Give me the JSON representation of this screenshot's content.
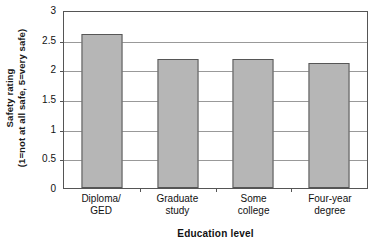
{
  "chart_data": {
    "type": "bar",
    "title": "",
    "categories": [
      "Diploma/ GED",
      "Graduate study",
      "Some college",
      "Four-year degree"
    ],
    "category_lines": [
      [
        "Diploma/",
        "GED"
      ],
      [
        "Graduate",
        "study"
      ],
      [
        "Some",
        "college"
      ],
      [
        "Four-year",
        "degree"
      ]
    ],
    "values": [
      2.6,
      2.18,
      2.17,
      2.1
    ],
    "xlabel": "Education level",
    "ylabel": "Safety rating",
    "ylabel_sub": "(1=not at all safe, 5=very safe)",
    "ylim": [
      0,
      3
    ],
    "ytick_values": [
      3,
      2.5,
      2,
      1.5,
      1,
      0.5,
      0
    ],
    "ytick_labels": [
      "3",
      "2.5",
      "2",
      "1.5",
      "1",
      "0.5",
      "0"
    ],
    "grid": true,
    "legend": false,
    "bar_color": "#b6b6b6",
    "bar_border_color": "#565656",
    "gridline_color": "#999999",
    "axis_color": "#555555"
  }
}
